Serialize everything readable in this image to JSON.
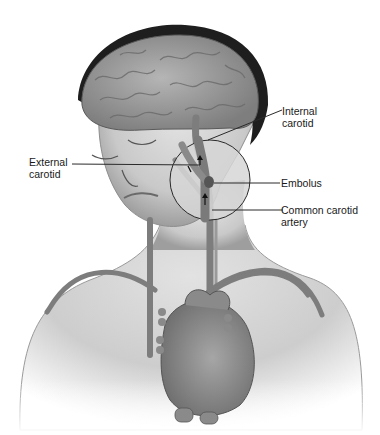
{
  "figure": {
    "labels": {
      "internal_carotid": "Internal\ncarotid",
      "external_carotid": "External\ncarotid",
      "embolus": "Embolus",
      "common_carotid": "Common carotid\nartery"
    },
    "colors": {
      "background": "#ffffff",
      "skin": "#d9d9d9",
      "skin_shadow": "#a8a8a8",
      "brain": "#9a9a9a",
      "hair": "#1e1e1e",
      "vessel": "#7d7d7d",
      "heart": "#8c8c8c",
      "line": "#2a2a2a"
    }
  }
}
